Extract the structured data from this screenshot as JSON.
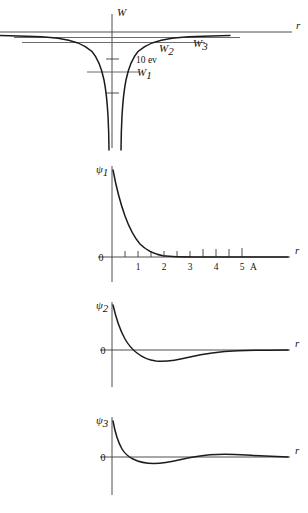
{
  "figure": {
    "ink_color": "#1c1c1c",
    "axis_color": "#3a3a3a",
    "level_color": "#5a5a5a",
    "background": "#ffffff"
  },
  "panels": {
    "potential": {
      "name": "potential-energy-panel",
      "y_axis_label": "W",
      "x_axis_label": "r",
      "scale_annotation": "10 ev",
      "levels": [
        {
          "label": "W",
          "sub": "1"
        },
        {
          "label": "W",
          "sub": "2"
        },
        {
          "label": "W",
          "sub": "3"
        }
      ]
    },
    "psi1": {
      "name": "psi1-panel",
      "y_axis_label": "ψ",
      "y_axis_sub": "1",
      "x_axis_label": "r",
      "zero_label": "0",
      "unit_label": "A",
      "tick_labels": [
        "1",
        "2",
        "3",
        "4",
        "5"
      ]
    },
    "psi2": {
      "name": "psi2-panel",
      "y_axis_label": "ψ",
      "y_axis_sub": "2",
      "x_axis_label": "r",
      "zero_label": "0"
    },
    "psi3": {
      "name": "psi3-panel",
      "y_axis_label": "ψ",
      "y_axis_sub": "3",
      "x_axis_label": "r",
      "zero_label": "0"
    }
  },
  "chart_data": [
    {
      "type": "line",
      "name": "coulomb-potential",
      "title": "W(r) Coulomb potential energy with bound states",
      "xlabel": "r",
      "ylabel": "W",
      "grid": false,
      "legend": false,
      "annotations": [
        "10 ev"
      ],
      "series": [
        {
          "name": "W(r)",
          "comment": "Symmetric Coulomb well, W = -k/|r|, asymptotic to 0 at large |r|, diverging downward at r = 0",
          "x": [
            -3.0,
            -2.5,
            -2.0,
            -1.6,
            -1.25,
            -1.0,
            -0.8,
            -0.6,
            -0.45,
            -0.32,
            -0.22,
            -0.14,
            -0.09,
            -0.05,
            -0.03,
            0.03,
            0.05,
            0.09,
            0.14,
            0.22,
            0.32,
            0.45,
            0.6,
            0.8,
            1.0,
            1.25,
            1.6,
            2.0,
            2.5,
            3.0
          ],
          "y": [
            -0.33,
            -0.4,
            -0.5,
            -0.63,
            -0.8,
            -1.0,
            -1.25,
            -1.67,
            -2.22,
            -3.13,
            -4.55,
            -7.14,
            -11.1,
            -20.0,
            -33.3,
            -33.3,
            -20.0,
            -11.1,
            -7.14,
            -4.55,
            -3.13,
            -2.22,
            -1.67,
            -1.25,
            -1.0,
            -0.8,
            -0.63,
            -0.5,
            -0.4,
            -0.33
          ]
        }
      ],
      "levels": [
        {
          "label": "W1",
          "energy": -2.4,
          "x_from": -0.78,
          "x_to": 0.6
        },
        {
          "label": "W2",
          "energy": -0.62,
          "x_from": -3.1,
          "x_to": 2.3
        },
        {
          "label": "W3",
          "energy": -0.3,
          "x_from": -3.4,
          "x_to": 2.95
        }
      ],
      "ylim": [
        -12,
        1
      ],
      "xlim": [
        -3.6,
        3.6
      ]
    },
    {
      "type": "line",
      "name": "psi1-radial-wavefunction",
      "title": "ψ1 radial wavefunction (ground state, 0 nodes)",
      "xlabel": "r",
      "ylabel": "ψ1",
      "xunit": "A",
      "grid": false,
      "legend": false,
      "xlim": [
        0,
        6.2
      ],
      "ylim": [
        -0.12,
        1.05
      ],
      "xticks": [
        0.5,
        1,
        1.5,
        2,
        2.5,
        3,
        3.5,
        4,
        4.5,
        5
      ],
      "xticklabels": [
        "",
        "1",
        "",
        "2",
        "",
        "3",
        "",
        "4",
        "",
        "5"
      ],
      "nodes": 0,
      "series": [
        {
          "name": "ψ1",
          "comment": "exp(-r/a) decay, a ~= 0.53 A",
          "x": [
            0.0,
            0.1,
            0.2,
            0.3,
            0.4,
            0.5,
            0.7,
            0.9,
            1.1,
            1.3,
            1.5,
            1.8,
            2.1,
            2.5,
            3.0,
            3.5,
            4.0,
            5.0,
            6.0
          ],
          "y": [
            1.0,
            0.83,
            0.69,
            0.57,
            0.47,
            0.39,
            0.27,
            0.18,
            0.125,
            0.086,
            0.059,
            0.033,
            0.019,
            0.008,
            0.003,
            0.001,
            0.0005,
            0.0,
            0.0
          ]
        }
      ]
    },
    {
      "type": "line",
      "name": "psi2-radial-wavefunction",
      "title": "ψ2 radial wavefunction (1 node)",
      "xlabel": "r",
      "ylabel": "ψ2",
      "grid": false,
      "legend": false,
      "xlim": [
        0,
        6.2
      ],
      "ylim": [
        -0.35,
        1.05
      ],
      "nodes": 1,
      "series": [
        {
          "name": "ψ2",
          "comment": "positive peak at origin, crosses zero near r=0.8, broad negative minimum near r=2.0, returns to 0",
          "x": [
            0.0,
            0.2,
            0.4,
            0.6,
            0.8,
            1.0,
            1.3,
            1.6,
            2.0,
            2.4,
            2.8,
            3.2,
            3.8,
            4.4,
            5.0,
            5.6,
            6.2
          ],
          "y": [
            1.0,
            0.6,
            0.32,
            0.12,
            0.0,
            -0.1,
            -0.19,
            -0.23,
            -0.24,
            -0.22,
            -0.19,
            -0.15,
            -0.1,
            -0.06,
            -0.035,
            -0.02,
            -0.01
          ]
        }
      ]
    },
    {
      "type": "line",
      "name": "psi3-radial-wavefunction",
      "title": "ψ3 radial wavefunction (2 nodes)",
      "xlabel": "r",
      "ylabel": "ψ3",
      "grid": false,
      "legend": false,
      "xlim": [
        0,
        6.2
      ],
      "ylim": [
        -0.35,
        1.05
      ],
      "nodes": 2,
      "series": [
        {
          "name": "ψ3",
          "comment": "positive peak at origin, first zero near r=0.55, negative minimum near r=1.5, second zero near r=2.8, small positive bump near r=4.0, decays",
          "x": [
            0.0,
            0.15,
            0.3,
            0.45,
            0.55,
            0.8,
            1.1,
            1.5,
            1.9,
            2.3,
            2.8,
            3.3,
            3.8,
            4.2,
            4.7,
            5.2,
            5.8,
            6.2
          ],
          "y": [
            1.0,
            0.58,
            0.28,
            0.08,
            0.0,
            -0.1,
            -0.15,
            -0.165,
            -0.15,
            -0.1,
            0.0,
            0.05,
            0.075,
            0.08,
            0.065,
            0.045,
            0.025,
            0.015
          ]
        }
      ]
    }
  ]
}
